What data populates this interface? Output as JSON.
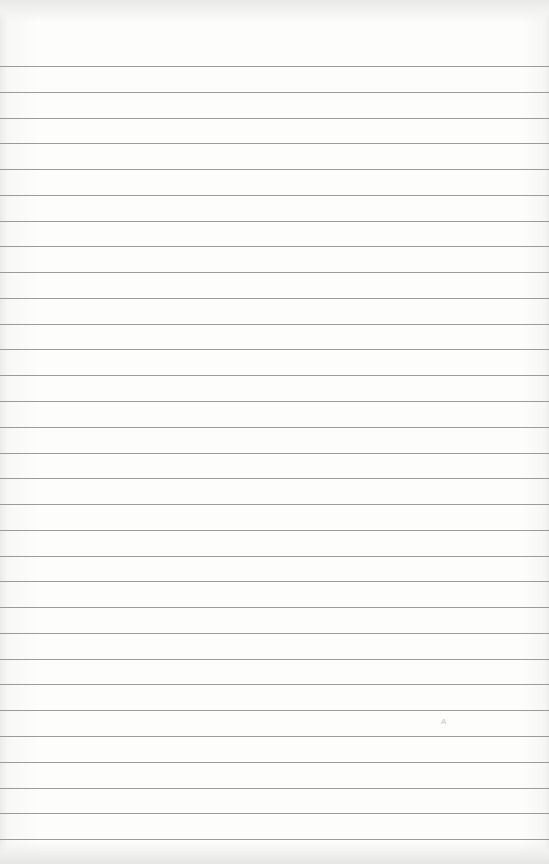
{
  "paper": {
    "type": "lined notebook paper",
    "background_color": "#fbfbfa",
    "rule_color": "#8a8a8a",
    "rule_count": 31,
    "first_rule_y": 66,
    "rule_spacing": 25.77
  },
  "marks": {
    "faint_glyph": "A"
  }
}
